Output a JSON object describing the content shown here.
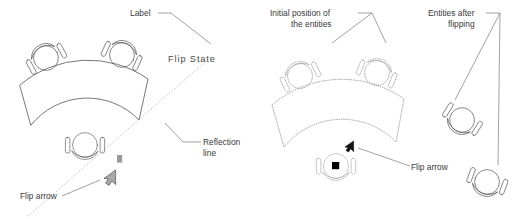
{
  "figure": {
    "panels": [
      {
        "id": "left",
        "name": "flip-state-panel",
        "labels": {
          "label_callout": "Label",
          "flip_state_text": "Flip State",
          "reflection_line_l1": "Reflection",
          "reflection_line_l2": "line",
          "flip_arrow": "Flip arrow"
        },
        "entities": {
          "chairs": 3,
          "table": "curved annular table",
          "grip_marker": "grip-marker",
          "cursor": "flip-arrow-cursor"
        }
      },
      {
        "id": "right",
        "name": "flip-result-panel",
        "labels": {
          "initial_position_l1": "Initial position of",
          "initial_position_l2": "the entities",
          "entities_after_l1": "Entities after",
          "entities_after_l2": "flipping",
          "flip_arrow": "Flip arrow"
        },
        "entities": {
          "initial_chairs": 3,
          "initial_table": "curved annular table (dotted)",
          "flipped_chairs": 2,
          "grip_marker": "grip-marker",
          "cursor": "flip-arrow-cursor"
        }
      }
    ]
  },
  "colors": {
    "geometry": "#4a4a4a",
    "dotted_geometry": "#8a8a8a",
    "reflection_line": "#b0b0b0",
    "leader": "#6e6e6e",
    "text": "#3a3a3a",
    "grip_grey": "#9a9a9a",
    "grip_black": "#000000",
    "background": "#ffffff"
  }
}
